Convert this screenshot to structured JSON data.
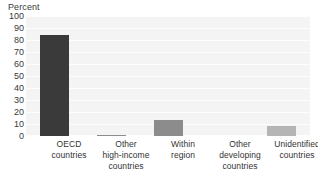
{
  "chart_data": {
    "type": "bar",
    "title": "",
    "ylabel": "Percent",
    "xlabel": "",
    "ylim": [
      0,
      100
    ],
    "yticks": [
      100,
      90,
      80,
      70,
      60,
      50,
      40,
      30,
      20,
      10,
      0
    ],
    "grid": true,
    "legend": "none",
    "categories": [
      "OECD countries",
      "Other high-income countries",
      "Within region",
      "Other developing countries",
      "Unidentified countries"
    ],
    "category_lines": [
      [
        "OECD",
        "countries"
      ],
      [
        "Other",
        "high-income",
        "countries"
      ],
      [
        "Within",
        "region"
      ],
      [
        "Other",
        "developing",
        "countries"
      ],
      [
        "Unidentified",
        "countries"
      ]
    ],
    "values": [
      84,
      1,
      13,
      0,
      8
    ],
    "bar_colors": [
      "#3a3a3a",
      "#8c8c8c",
      "#8c8c8c",
      "#b5b5b5",
      "#b5b5b5"
    ]
  },
  "axis": {
    "y_title": "Percent",
    "ticks": {
      "t100": "100",
      "t90": "90",
      "t80": "80",
      "t70": "70",
      "t60": "60",
      "t50": "50",
      "t40": "40",
      "t30": "30",
      "t20": "20",
      "t10": "10",
      "t0": "0"
    }
  },
  "categories": {
    "c0": {
      "l0": "OECD",
      "l1": "countries",
      "l2": ""
    },
    "c1": {
      "l0": "Other",
      "l1": "high-income",
      "l2": "countries"
    },
    "c2": {
      "l0": "Within",
      "l1": "region",
      "l2": ""
    },
    "c3": {
      "l0": "Other",
      "l1": "developing",
      "l2": "countries"
    },
    "c4": {
      "l0": "Unidentified",
      "l1": "countries",
      "l2": ""
    }
  },
  "colors": {
    "plot_background": "#f4f4f4",
    "gridline": "#fdfdfd",
    "bar_dark": "#3a3a3a",
    "bar_mid": "#8c8c8c",
    "bar_light": "#b5b5b5",
    "text": "#333333"
  }
}
